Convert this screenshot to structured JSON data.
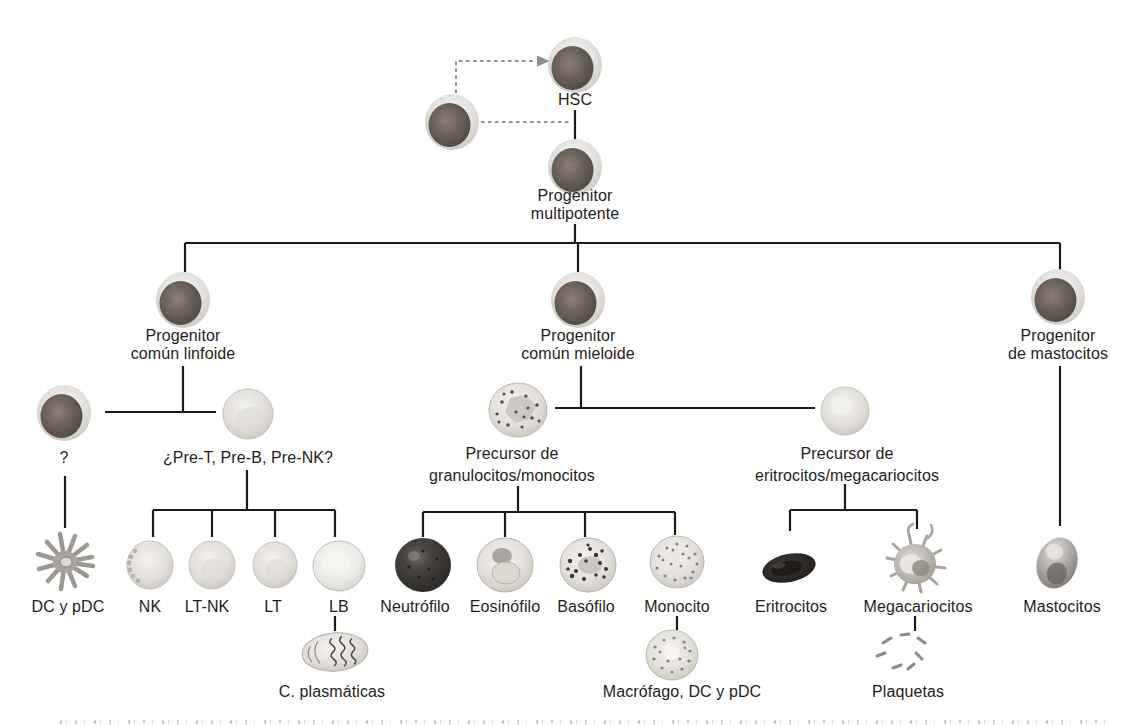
{
  "figure": "hematopoiesis-lineage-diagram",
  "colors": {
    "background": "#ffffff",
    "line": "#1b1b1b",
    "dashed_line": "#8f8f8f",
    "text": "#1f1d1b",
    "dark_cell_nucleus": "#6e665d",
    "light_cell": "#e4e1dc",
    "erythrocyte": "#211d1b"
  },
  "nodes": {
    "hsc": "HSC",
    "multipotent_l1": "Progenitor",
    "multipotent_l2": "multipotente",
    "lymphoid_l1": "Progenitor",
    "lymphoid_l2": "común linfoide",
    "myeloid_l1": "Progenitor",
    "myeloid_l2": "común mieloide",
    "mast_prog_l1": "Progenitor",
    "mast_prog_l2": "de mastocitos",
    "unknown": "?",
    "pre_lymph": "¿Pre-T, Pre-B, Pre-NK?",
    "gm_prec_l1": "Precursor de",
    "gm_prec_l2": "granulocitos/monocitos",
    "em_prec_l1": "Precursor de",
    "em_prec_l2": "eritrocitos/megacariocitos",
    "dc": "DC y pDC",
    "nk": "NK",
    "lt_nk": "LT-NK",
    "lt": "LT",
    "lb": "LB",
    "plasma": "C. plasmáticas",
    "neutrophil": "Neutrófilo",
    "eosinophil": "Eosinófilo",
    "basophil": "Basófilo",
    "monocyte": "Monocito",
    "macrophage": "Macrófago, DC y pDC",
    "erythrocytes": "Eritrocitos",
    "megakaryocytes": "Megacariocitos",
    "platelets": "Plaquetas",
    "mast_cells": "Mastocitos"
  }
}
